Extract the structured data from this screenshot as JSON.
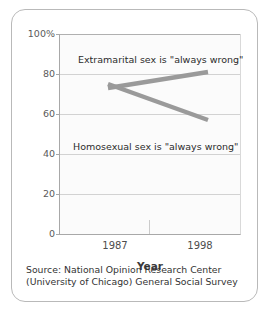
{
  "chart_data": {
    "type": "line",
    "title": "",
    "xlabel": "Year",
    "ylabel": "",
    "x": [
      "1987",
      "1998"
    ],
    "categories": [
      "1987",
      "1998"
    ],
    "series": [
      {
        "name": "Extramarital sex is \"always wrong\"",
        "values": [
          73,
          81
        ],
        "color": "#9a9a9a"
      },
      {
        "name": "Homosexual sex is \"always wrong\"",
        "values": [
          75,
          57
        ],
        "color": "#9a9a9a"
      }
    ],
    "ylim": [
      0,
      100
    ],
    "yticks": [
      0,
      20,
      40,
      60,
      80,
      100
    ],
    "ytick_labels": [
      "0",
      "20",
      "40",
      "60",
      "80",
      "100%"
    ],
    "xtick_labels": [
      "1987",
      "1998"
    ],
    "grid": true,
    "legend": "in-plot annotations"
  },
  "axes": {
    "y_labels": [
      "100%",
      "80",
      "60",
      "40",
      "20",
      "0"
    ],
    "x_labels": [
      "1987",
      "1998"
    ],
    "x_title": "Year"
  },
  "annotations": {
    "extramarital": "Extramarital sex is \"always wrong\"",
    "homosexual": "Homosexual sex is \"always wrong\""
  },
  "source": {
    "line1": "Source: National Opinion Research Center",
    "line2": "(University of Chicago) General Social Survey"
  },
  "colors": {
    "line": "#9a9a9a",
    "grid": "#d2d2d2",
    "axis": "#a8a8a8",
    "plot_background": "#fbfbfb",
    "card_border": "#b9b9b9",
    "text": "#333333"
  }
}
